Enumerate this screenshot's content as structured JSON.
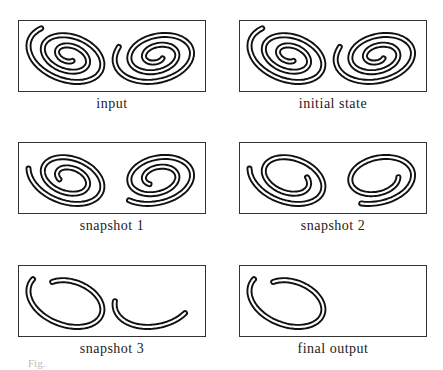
{
  "figure": {
    "panels": [
      {
        "id": "input",
        "caption": "input",
        "curves": "full"
      },
      {
        "id": "initial-state",
        "caption": "initial state",
        "curves": "full"
      },
      {
        "id": "snapshot-1",
        "caption": "snapshot 1",
        "curves": "trim1"
      },
      {
        "id": "snapshot-2",
        "caption": "snapshot 2",
        "curves": "trim2"
      },
      {
        "id": "snapshot-3",
        "caption": "snapshot 3",
        "curves": "trim3"
      },
      {
        "id": "final-output",
        "caption": "final output",
        "curves": "final"
      }
    ],
    "footer_text": "Fig."
  }
}
